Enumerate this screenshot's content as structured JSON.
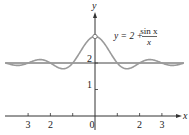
{
  "chart_data": {
    "type": "line",
    "title": "",
    "function_label": {
      "lhs": "y = 2 + ",
      "numerator": "sin x",
      "denominator": "x"
    },
    "xlabel": "x",
    "ylabel": "y",
    "x_ticks": [
      {
        "value": -9.4248,
        "label": "3"
      },
      {
        "value": -6.2832,
        "label": "2"
      },
      {
        "value": -3.1416,
        "label": ""
      },
      {
        "value": 0,
        "label": "0"
      },
      {
        "value": 3.1416,
        "label": ""
      },
      {
        "value": 6.2832,
        "label": "2"
      },
      {
        "value": 9.4248,
        "label": "3"
      }
    ],
    "y_ticks": [
      {
        "value": 1,
        "label": "1"
      },
      {
        "value": 2,
        "label": "2"
      }
    ],
    "asymptote_y": 2,
    "hole": {
      "x": 0,
      "y": 3
    },
    "xlim": [
      -13.3,
      13.3
    ],
    "ylim": [
      -0.7,
      4.2
    ],
    "series": [
      {
        "name": "y = 2 + sin x / x",
        "formula": "2 + sin(x)/x",
        "color": "#9a9a9a"
      }
    ],
    "grid": false,
    "legend": "none",
    "sample_points": {
      "x": [
        -12,
        -9.42,
        -7.73,
        -6.28,
        -4.49,
        -3.14,
        -1.5,
        0,
        1.5,
        3.14,
        4.49,
        6.28,
        7.73,
        9.42,
        12
      ],
      "y": [
        2.045,
        2.0,
        2.128,
        2.0,
        1.783,
        2.0,
        2.665,
        3.0,
        2.665,
        2.0,
        1.783,
        2.0,
        2.128,
        2.0,
        2.045
      ]
    }
  },
  "colors": {
    "axis": "#333333",
    "curve": "#9a9a9a",
    "asymptote": "#444444"
  }
}
